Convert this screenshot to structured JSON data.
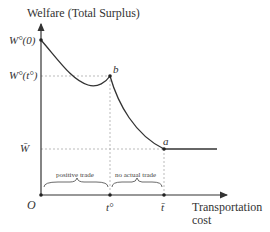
{
  "diagram": {
    "y_axis_label": "Welfare (Total Surplus)",
    "x_axis_label_line1": "Transportation",
    "x_axis_label_line2": "cost",
    "origin_label": "O",
    "y_ticks": {
      "w0": "W°(0)",
      "wto": "W°(t°)",
      "wbar": "W̄"
    },
    "x_ticks": {
      "to": "t°",
      "tbar": "t̄"
    },
    "points": {
      "a": "a",
      "b": "b"
    },
    "regions": {
      "positive": "positive trade",
      "no_trade": "no actual trade"
    },
    "colors": {
      "curve": "#333333",
      "axis": "#333333",
      "guide": "#aaaaaa"
    }
  }
}
